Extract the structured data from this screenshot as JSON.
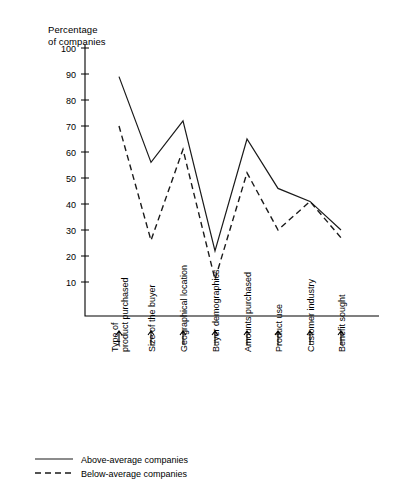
{
  "chart_data": {
    "type": "line",
    "title": "",
    "ylabel_line1": "Percentage",
    "ylabel_line2": "of companies",
    "xlabel": "",
    "ylim": [
      0,
      100
    ],
    "yticks": [
      10,
      20,
      30,
      40,
      50,
      60,
      70,
      80,
      90,
      100
    ],
    "grid": false,
    "legend_position": "bottom-left",
    "categories": [
      "Type of\nproduct purchased",
      "Size of the buyer",
      "Geographical location",
      "Buyer demographics",
      "Amounts purchased",
      "Product use",
      "Customer industry",
      "Benefit sought"
    ],
    "category_lines": [
      [
        "Type of",
        "product purchased"
      ],
      [
        "Size of the buyer"
      ],
      [
        "Geographical location"
      ],
      [
        "Buyer demographics"
      ],
      [
        "Amounts purchased"
      ],
      [
        "Product use"
      ],
      [
        "Customer industry"
      ],
      [
        "Benefit sought"
      ]
    ],
    "series": [
      {
        "name": "Above-average companies",
        "style": "solid",
        "values": [
          89,
          56,
          72,
          22,
          65,
          46,
          41,
          30
        ]
      },
      {
        "name": "Below-average companies",
        "style": "dashed",
        "values": [
          70,
          26,
          61,
          11,
          52,
          30,
          41,
          27
        ]
      }
    ]
  },
  "legend": {
    "items": [
      {
        "label": "Above-average companies",
        "style": "solid"
      },
      {
        "label": "Below-average companies",
        "style": "dashed"
      }
    ]
  },
  "colors": {
    "ink": "#1a1a1a",
    "background": "#ffffff"
  }
}
